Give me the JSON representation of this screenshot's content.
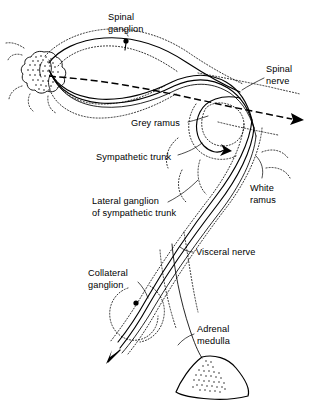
{
  "figure": {
    "background_color": "#ffffff",
    "ink_color": "#000000",
    "width": 316,
    "height": 404
  },
  "labels": [
    {
      "id": "spinal-ganglion",
      "text": "Spinal\nganglion",
      "line1": "Spinal",
      "line2": "ganglion",
      "x": 108,
      "y": 12,
      "align": "left"
    },
    {
      "id": "spinal-nerve",
      "text": "Spinal\nnerve",
      "line1": "Spinal",
      "line2": "nerve",
      "x": 266,
      "y": 64,
      "align": "left"
    },
    {
      "id": "grey-ramus",
      "text": "Grey ramus",
      "line1": "Grey ramus",
      "line2": "",
      "x": 131,
      "y": 118,
      "align": "left"
    },
    {
      "id": "sympathetic-trunk",
      "text": "Sympathetic trunk",
      "line1": "Sympathetic trunk",
      "line2": "",
      "x": 96,
      "y": 152,
      "align": "left"
    },
    {
      "id": "white-ramus",
      "text": "White\nramus",
      "line1": "White",
      "line2": "ramus",
      "x": 250,
      "y": 183,
      "align": "left"
    },
    {
      "id": "lateral-ganglion",
      "text": "Lateral ganglion\nof sympathetic trunk",
      "line1": "Lateral ganglion",
      "line2": "of sympathetic trunk",
      "x": 92,
      "y": 196,
      "align": "left"
    },
    {
      "id": "visceral-nerve",
      "text": "Visceral nerve",
      "line1": "Visceral nerve",
      "line2": "",
      "x": 196,
      "y": 247,
      "align": "left"
    },
    {
      "id": "collateral-ganglion",
      "text": "Collateral\nganglion",
      "line1": "Collateral",
      "line2": "ganglion",
      "x": 88,
      "y": 268,
      "align": "left"
    },
    {
      "id": "adrenal-medulla",
      "text": "Adrenal\nmedulla",
      "line1": "Adrenal",
      "line2": "medulla",
      "x": 197,
      "y": 324,
      "align": "left"
    }
  ],
  "structures": [
    {
      "id": "spinal-cord",
      "name": "spinal cord cross-section with grey matter"
    },
    {
      "id": "dorsal-root",
      "name": "dorsal root and spinal ganglion neuron"
    },
    {
      "id": "spinal-nerve-path",
      "name": "spinal nerve (dashed sensory pathway with arrow)"
    },
    {
      "id": "sympathetic-ganglion-loop",
      "name": "lateral ganglion of sympathetic trunk loop with arrowhead"
    },
    {
      "id": "grey-ramus-fiber",
      "name": "grey ramus communicans fiber"
    },
    {
      "id": "white-ramus-fiber",
      "name": "white ramus communicans fiber"
    },
    {
      "id": "visceral-nerve-fiber",
      "name": "visceral nerve fibers running to collateral ganglion"
    },
    {
      "id": "collateral-ganglion-body",
      "name": "collateral ganglion with synapse and arrow"
    },
    {
      "id": "adrenal-medulla-organ",
      "name": "adrenal medulla organ with stippled interior"
    }
  ]
}
